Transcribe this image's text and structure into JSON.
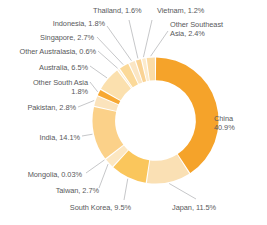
{
  "chart_data": {
    "type": "pie",
    "variant": "donut",
    "title": "",
    "subtitle": "",
    "xlabel": "",
    "ylabel": "",
    "legend_position": "none",
    "grid": false,
    "value_unit": "%",
    "start_angle_deg": 0,
    "direction": "clockwise",
    "hole_ratio": 0.64,
    "background_color": "#ffffff",
    "label_color": "#58595b",
    "leader_line_color": "#a7a9ac",
    "categories": [
      "China",
      "Japan",
      "South Korea",
      "Taiwan",
      "Mongolia",
      "India",
      "Pakistan",
      "Other South Asia",
      "Australia",
      "Other Australasia",
      "Singapore",
      "Indonesia",
      "Thailand",
      "Vietnam",
      "Other Southeast Asia"
    ],
    "values": [
      40.9,
      11.5,
      9.5,
      2.7,
      0.03,
      14.1,
      2.8,
      1.8,
      6.5,
      0.6,
      2.7,
      1.8,
      1.6,
      1.2,
      2.4
    ],
    "colors": [
      "#F5A32A",
      "#FAE0B4",
      "#FAC65C",
      "#FCE7C2",
      "#FDF3E0",
      "#FBD189",
      "#FBE3BC",
      "#F7A833",
      "#FBE0AE",
      "#FCEBCD",
      "#FBD999",
      "#FBE6C4",
      "#FAD394",
      "#FCEBCC",
      "#FBDCA6"
    ],
    "labels": [
      {
        "key": "china",
        "text": "China\n40.9%"
      },
      {
        "key": "japan",
        "text": "Japan, 11.5%"
      },
      {
        "key": "south-korea",
        "text": "South Korea, 9.5%"
      },
      {
        "key": "taiwan",
        "text": "Taiwan, 2.7%"
      },
      {
        "key": "mongolia",
        "text": "Mongolia, 0.03%"
      },
      {
        "key": "india",
        "text": "India, 14.1%"
      },
      {
        "key": "pakistan",
        "text": "Pakistan, 2.8%"
      },
      {
        "key": "other-south-asia",
        "text": "Other South Asia\n1.8%"
      },
      {
        "key": "australia",
        "text": "Australia, 6.5%"
      },
      {
        "key": "other-australasia",
        "text": "Other Australasia, 0.6%"
      },
      {
        "key": "singapore",
        "text": "Singapore, 2.7%"
      },
      {
        "key": "indonesia",
        "text": "Indonesia, 1.8%"
      },
      {
        "key": "thailand",
        "text": "Thailand, 1.6%"
      },
      {
        "key": "vietnam",
        "text": "Vietnam, 1.2%"
      },
      {
        "key": "other-southeast-asia",
        "text": "Other Southeast\nAsia, 2.4%"
      }
    ]
  }
}
